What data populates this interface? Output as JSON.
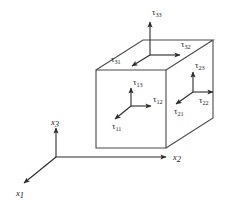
{
  "figure": {
    "background_color": "#ffffff",
    "line_color": "#4a4a4a",
    "arrow_color": "#2b2b2b",
    "text_color": "#1a1a1a"
  },
  "axes": {
    "x1": {
      "symbol": "x",
      "subscript": "1",
      "direction": "down-left"
    },
    "x2": {
      "symbol": "x",
      "subscript": "2",
      "direction": "right"
    },
    "x3": {
      "symbol": "x",
      "subscript": "3",
      "direction": "up"
    }
  },
  "front_face": {
    "name": "x1-face",
    "stresses": [
      {
        "symbol": "τ",
        "subscript": "13",
        "direction": "up"
      },
      {
        "symbol": "τ",
        "subscript": "12",
        "direction": "right"
      },
      {
        "symbol": "τ",
        "subscript": "11",
        "direction": "down-left"
      }
    ]
  },
  "right_face": {
    "name": "x2-face",
    "stresses": [
      {
        "symbol": "τ",
        "subscript": "23",
        "direction": "up"
      },
      {
        "symbol": "τ",
        "subscript": "22",
        "direction": "right"
      },
      {
        "symbol": "τ",
        "subscript": "21",
        "direction": "down-left"
      }
    ]
  },
  "top_face": {
    "name": "x3-face",
    "stresses": [
      {
        "symbol": "τ",
        "subscript": "33",
        "direction": "up"
      },
      {
        "symbol": "τ",
        "subscript": "32",
        "direction": "right"
      },
      {
        "symbol": "τ",
        "subscript": "31",
        "direction": "down-left"
      }
    ]
  }
}
